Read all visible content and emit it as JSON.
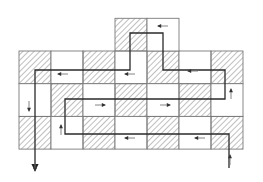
{
  "diagram": {
    "title": "",
    "colors": {
      "background": "#ffffff",
      "grid_line": "#7a7a7a",
      "hatch": "#8a8a8a",
      "path": "#2a2a2a",
      "arrow": "#333333"
    },
    "grid": {
      "origin_x": 19,
      "origin_y": 51,
      "cell_w": 32,
      "cell_h": 32.7,
      "rows": 3,
      "cols": 7,
      "pattern": [
        [
          "H",
          "W",
          "H",
          "W",
          "H",
          "W",
          "H"
        ],
        [
          "W",
          "H",
          "W",
          "H",
          "W",
          "H",
          "W"
        ],
        [
          "H",
          "W",
          "H",
          "W",
          "H",
          "W",
          "H"
        ]
      ],
      "top_cells": [
        {
          "col": 3,
          "fill": "H"
        },
        {
          "col": 4,
          "fill": "W"
        }
      ]
    },
    "path_points": [
      [
        229,
        168
      ],
      [
        229,
        134
      ],
      [
        65,
        134
      ],
      [
        65,
        99
      ],
      [
        225,
        99
      ],
      [
        225,
        70
      ],
      [
        163,
        70
      ],
      [
        163,
        33
      ],
      [
        130,
        33
      ],
      [
        130,
        70
      ],
      [
        35,
        70
      ],
      [
        35,
        170
      ]
    ],
    "direction_arrows": [
      {
        "x": 230,
        "y": 160,
        "dir": "up"
      },
      {
        "x": 200,
        "y": 138,
        "dir": "left"
      },
      {
        "x": 130,
        "y": 138,
        "dir": "left"
      },
      {
        "x": 61,
        "y": 130,
        "dir": "up"
      },
      {
        "x": 100,
        "y": 105,
        "dir": "right"
      },
      {
        "x": 165,
        "y": 105,
        "dir": "right"
      },
      {
        "x": 231,
        "y": 94,
        "dir": "up"
      },
      {
        "x": 193,
        "y": 71,
        "dir": "left"
      },
      {
        "x": 130,
        "y": 74,
        "dir": "left"
      },
      {
        "x": 63,
        "y": 74,
        "dir": "left"
      },
      {
        "x": 163,
        "y": 26,
        "dir": "left"
      },
      {
        "x": 29,
        "y": 106,
        "dir": "down"
      },
      {
        "x": 35,
        "y": 166,
        "dir": "down"
      }
    ]
  }
}
